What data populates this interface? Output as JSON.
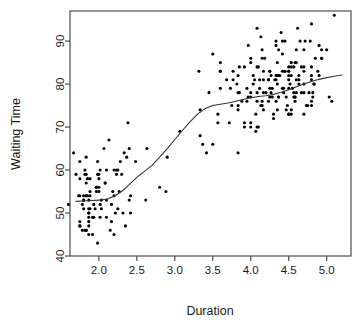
{
  "chart_data": {
    "type": "scatter",
    "title": "",
    "xlabel": "Duration",
    "ylabel": "Waiting Time",
    "xlim": [
      1.62,
      5.32
    ],
    "ylim": [
      40.0,
      97.0
    ],
    "grid": false,
    "legend": null,
    "xticks": [
      "2.0",
      "2.5",
      "3.0",
      "3.5",
      "4.0",
      "4.5",
      "5.0"
    ],
    "xtick_values": [
      2.0,
      2.5,
      3.0,
      3.5,
      4.0,
      4.5,
      5.0
    ],
    "yticks": [
      "40",
      "50",
      "60",
      "70",
      "80",
      "90"
    ],
    "ytick_values": [
      40,
      50,
      60,
      70,
      80,
      90
    ],
    "marker": {
      "shape": "filled-circle",
      "color": "#000000",
      "size_px": 3.1
    },
    "series": [
      {
        "name": "observations",
        "type": "scatter",
        "points": [
          [
            3.6,
            79
          ],
          [
            1.8,
            54
          ],
          [
            3.333,
            74
          ],
          [
            2.283,
            62
          ],
          [
            4.533,
            85
          ],
          [
            2.883,
            55
          ],
          [
            4.7,
            88
          ],
          [
            3.6,
            85
          ],
          [
            1.95,
            51
          ],
          [
            4.35,
            85
          ],
          [
            1.833,
            54
          ],
          [
            3.917,
            84
          ],
          [
            4.2,
            78
          ],
          [
            1.75,
            47
          ],
          [
            4.7,
            83
          ],
          [
            2.167,
            52
          ],
          [
            1.75,
            62
          ],
          [
            4.8,
            84
          ],
          [
            1.6,
            52
          ],
          [
            4.25,
            79
          ],
          [
            1.8,
            51
          ],
          [
            1.75,
            47
          ],
          [
            3.45,
            78
          ],
          [
            3.067,
            69
          ],
          [
            4.533,
            74
          ],
          [
            3.6,
            83
          ],
          [
            1.967,
            55
          ],
          [
            4.083,
            76
          ],
          [
            3.85,
            78
          ],
          [
            4.433,
            79
          ],
          [
            4.3,
            73
          ],
          [
            4.467,
            77
          ],
          [
            3.367,
            66
          ],
          [
            4.033,
            80
          ],
          [
            3.833,
            74
          ],
          [
            2.017,
            52
          ],
          [
            1.867,
            48
          ],
          [
            4.833,
            80
          ],
          [
            1.833,
            59
          ],
          [
            4.783,
            90
          ],
          [
            4.35,
            80
          ],
          [
            1.883,
            58
          ],
          [
            4.567,
            84
          ],
          [
            1.75,
            58
          ],
          [
            4.533,
            73
          ],
          [
            3.317,
            83
          ],
          [
            3.833,
            64
          ],
          [
            2.1,
            53
          ],
          [
            4.633,
            82
          ],
          [
            2.0,
            59
          ],
          [
            4.8,
            75
          ],
          [
            4.716,
            90
          ],
          [
            1.833,
            54
          ],
          [
            4.833,
            80
          ],
          [
            1.733,
            54
          ],
          [
            4.883,
            83
          ],
          [
            3.717,
            71
          ],
          [
            1.667,
            64
          ],
          [
            4.567,
            77
          ],
          [
            4.317,
            81
          ],
          [
            2.233,
            59
          ],
          [
            4.5,
            84
          ],
          [
            1.75,
            48
          ],
          [
            4.8,
            82
          ],
          [
            1.817,
            60
          ],
          [
            4.4,
            92
          ],
          [
            4.167,
            78
          ],
          [
            4.7,
            78
          ],
          [
            2.067,
            65
          ],
          [
            4.7,
            73
          ],
          [
            4.033,
            82
          ],
          [
            1.967,
            56
          ],
          [
            4.5,
            79
          ],
          [
            4.0,
            71
          ],
          [
            1.983,
            62
          ],
          [
            5.067,
            76
          ],
          [
            2.017,
            60
          ],
          [
            4.567,
            78
          ],
          [
            3.883,
            76
          ],
          [
            3.6,
            83
          ],
          [
            4.133,
            75
          ],
          [
            4.333,
            82
          ],
          [
            4.1,
            70
          ],
          [
            2.633,
            65
          ],
          [
            4.067,
            73
          ],
          [
            4.933,
            88
          ],
          [
            3.95,
            76
          ],
          [
            4.517,
            80
          ],
          [
            2.167,
            48
          ],
          [
            4.0,
            86
          ],
          [
            2.2,
            60
          ],
          [
            4.333,
            90
          ],
          [
            1.867,
            50
          ],
          [
            4.817,
            78
          ],
          [
            1.833,
            63
          ],
          [
            4.3,
            72
          ],
          [
            4.667,
            84
          ],
          [
            3.75,
            75
          ],
          [
            1.867,
            51
          ],
          [
            4.9,
            82
          ],
          [
            2.483,
            62
          ],
          [
            4.367,
            88
          ],
          [
            2.1,
            49
          ],
          [
            4.5,
            83
          ],
          [
            4.05,
            81
          ],
          [
            1.867,
            47
          ],
          [
            4.7,
            84
          ],
          [
            1.783,
            52
          ],
          [
            4.85,
            86
          ],
          [
            3.683,
            81
          ],
          [
            4.733,
            75
          ],
          [
            2.3,
            59
          ],
          [
            4.9,
            89
          ],
          [
            4.417,
            79
          ],
          [
            1.7,
            59
          ],
          [
            4.633,
            81
          ],
          [
            2.317,
            50
          ],
          [
            4.6,
            85
          ],
          [
            1.817,
            59
          ],
          [
            4.417,
            87
          ],
          [
            2.617,
            53
          ],
          [
            4.067,
            69
          ],
          [
            4.25,
            77
          ],
          [
            1.967,
            56
          ],
          [
            4.6,
            88
          ],
          [
            3.767,
            81
          ],
          [
            1.917,
            45
          ],
          [
            4.5,
            82
          ],
          [
            2.267,
            55
          ],
          [
            4.65,
            90
          ],
          [
            1.867,
            45
          ],
          [
            4.167,
            83
          ],
          [
            2.8,
            56
          ],
          [
            4.333,
            89
          ],
          [
            1.833,
            46
          ],
          [
            4.383,
            82
          ],
          [
            1.883,
            51
          ],
          [
            4.933,
            86
          ],
          [
            2.033,
            53
          ],
          [
            3.733,
            79
          ],
          [
            4.233,
            81
          ],
          [
            2.233,
            60
          ],
          [
            4.533,
            82
          ],
          [
            4.817,
            77
          ],
          [
            4.333,
            76
          ],
          [
            1.983,
            59
          ],
          [
            4.633,
            80
          ],
          [
            2.017,
            49
          ],
          [
            5.1,
            96
          ],
          [
            1.8,
            53
          ],
          [
            5.033,
            77
          ],
          [
            4.0,
            77
          ],
          [
            2.4,
            65
          ],
          [
            4.6,
            81
          ],
          [
            3.567,
            71
          ],
          [
            4.0,
            70
          ],
          [
            4.5,
            81
          ],
          [
            4.083,
            93
          ],
          [
            1.8,
            53
          ],
          [
            3.967,
            89
          ],
          [
            2.2,
            45
          ],
          [
            4.15,
            86
          ],
          [
            2.0,
            58
          ],
          [
            3.833,
            78
          ],
          [
            3.5,
            66
          ],
          [
            4.583,
            76
          ],
          [
            2.367,
            63
          ],
          [
            5.0,
            88
          ],
          [
            1.933,
            52
          ],
          [
            4.617,
            93
          ],
          [
            1.917,
            49
          ],
          [
            2.083,
            57
          ],
          [
            4.583,
            77
          ],
          [
            3.333,
            68
          ],
          [
            4.167,
            81
          ],
          [
            4.333,
            81
          ],
          [
            4.5,
            73
          ],
          [
            2.417,
            50
          ],
          [
            4.0,
            85
          ],
          [
            4.167,
            74
          ],
          [
            1.883,
            55
          ],
          [
            4.583,
            77
          ],
          [
            4.25,
            83
          ],
          [
            3.767,
            83
          ],
          [
            2.033,
            51
          ],
          [
            4.433,
            78
          ],
          [
            4.083,
            84
          ],
          [
            1.833,
            46
          ],
          [
            4.417,
            83
          ],
          [
            2.183,
            55
          ],
          [
            4.8,
            81
          ],
          [
            1.833,
            57
          ],
          [
            4.8,
            76
          ],
          [
            4.1,
            84
          ],
          [
            3.966,
            77
          ],
          [
            4.233,
            81
          ],
          [
            3.5,
            87
          ],
          [
            4.366,
            77
          ],
          [
            2.25,
            51
          ],
          [
            4.667,
            78
          ],
          [
            2.1,
            60
          ],
          [
            4.35,
            82
          ],
          [
            4.133,
            91
          ],
          [
            1.867,
            53
          ],
          [
            4.6,
            78
          ],
          [
            1.783,
            46
          ],
          [
            4.367,
            77
          ],
          [
            3.85,
            84
          ],
          [
            1.933,
            49
          ],
          [
            4.5,
            83
          ],
          [
            2.383,
            71
          ],
          [
            4.7,
            80
          ],
          [
            1.867,
            49
          ],
          [
            3.833,
            75
          ],
          [
            3.417,
            64
          ],
          [
            4.233,
            76
          ],
          [
            2.4,
            53
          ],
          [
            4.8,
            94
          ],
          [
            2.0,
            55
          ],
          [
            4.15,
            76
          ],
          [
            1.867,
            50
          ],
          [
            4.267,
            82
          ],
          [
            1.75,
            54
          ],
          [
            4.483,
            75
          ],
          [
            4.0,
            78
          ],
          [
            4.117,
            79
          ],
          [
            4.083,
            78
          ],
          [
            4.267,
            78
          ],
          [
            3.917,
            70
          ],
          [
            4.55,
            79
          ],
          [
            4.083,
            70
          ],
          [
            2.417,
            54
          ],
          [
            4.183,
            86
          ],
          [
            2.217,
            50
          ],
          [
            4.45,
            90
          ],
          [
            1.883,
            54
          ],
          [
            1.85,
            54
          ],
          [
            4.283,
            77
          ],
          [
            3.95,
            79
          ],
          [
            2.333,
            64
          ],
          [
            4.15,
            75
          ],
          [
            2.35,
            47
          ],
          [
            4.933,
            86
          ],
          [
            2.9,
            63
          ],
          [
            4.583,
            85
          ],
          [
            3.833,
            82
          ],
          [
            2.083,
            57
          ],
          [
            4.367,
            82
          ],
          [
            2.133,
            67
          ],
          [
            4.35,
            74
          ],
          [
            2.2,
            54
          ],
          [
            4.45,
            83
          ],
          [
            3.567,
            73
          ],
          [
            4.5,
            73
          ],
          [
            4.15,
            88
          ],
          [
            3.817,
            80
          ],
          [
            3.917,
            71
          ],
          [
            4.45,
            83
          ],
          [
            2.0,
            56
          ],
          [
            4.283,
            79
          ],
          [
            4.767,
            78
          ],
          [
            4.533,
            84
          ],
          [
            1.85,
            58
          ],
          [
            4.25,
            83
          ],
          [
            1.983,
            43
          ],
          [
            2.25,
            60
          ],
          [
            4.75,
            75
          ],
          [
            4.117,
            81
          ],
          [
            2.15,
            46
          ],
          [
            4.417,
            90
          ],
          [
            1.817,
            46
          ],
          [
            4.467,
            74
          ]
        ]
      },
      {
        "name": "loess-smooth",
        "type": "line",
        "color": "#333333",
        "width_px": 1.1,
        "points": [
          [
            1.7,
            52.7
          ],
          [
            1.8,
            52.8
          ],
          [
            1.9,
            52.9
          ],
          [
            2.0,
            53.0
          ],
          [
            2.1,
            53.2
          ],
          [
            2.2,
            53.9
          ],
          [
            2.3,
            55.0
          ],
          [
            2.4,
            56.6
          ],
          [
            2.5,
            58.3
          ],
          [
            2.6,
            59.7
          ],
          [
            2.7,
            61.1
          ],
          [
            2.8,
            63.0
          ],
          [
            2.9,
            65.0
          ],
          [
            3.0,
            67.1
          ],
          [
            3.1,
            69.2
          ],
          [
            3.2,
            71.2
          ],
          [
            3.3,
            73.0
          ],
          [
            3.4,
            74.3
          ],
          [
            3.5,
            75.0
          ],
          [
            3.6,
            75.3
          ],
          [
            3.7,
            75.6
          ],
          [
            3.8,
            76.0
          ],
          [
            3.9,
            76.4
          ],
          [
            4.0,
            76.8
          ],
          [
            4.1,
            77.1
          ],
          [
            4.2,
            77.3
          ],
          [
            4.3,
            77.6
          ],
          [
            4.4,
            78.1
          ],
          [
            4.5,
            78.7
          ],
          [
            4.6,
            79.4
          ],
          [
            4.7,
            80.0
          ],
          [
            4.8,
            80.6
          ],
          [
            4.9,
            81.1
          ],
          [
            5.0,
            81.5
          ],
          [
            5.1,
            81.8
          ],
          [
            5.2,
            82.1
          ]
        ]
      }
    ]
  },
  "figure": {
    "background_color": "#ffffff",
    "axis_color": "#4d4d4d",
    "text_color": "#1a1a1a"
  }
}
